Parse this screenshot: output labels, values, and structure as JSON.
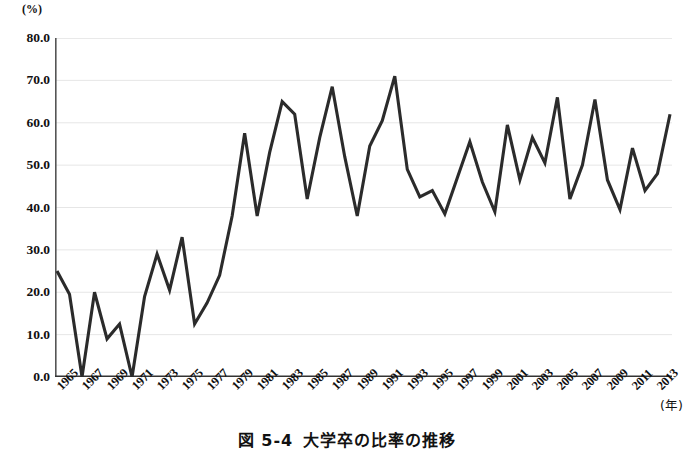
{
  "figure": {
    "caption_number": "図 5-4",
    "caption_title": "大学卒の比率の推移",
    "y_unit": "(%)",
    "x_unit": "(年)"
  },
  "chart_data": {
    "type": "line",
    "title": "大学卒の比率の推移",
    "xlabel": "(年)",
    "ylabel": "(%)",
    "ylim": [
      0.0,
      80.0
    ],
    "xlim": [
      1965,
      2014
    ],
    "grid": true,
    "legend": "none",
    "line_color": "#2b2b2b",
    "y_ticks": [
      "0.0",
      "10.0",
      "20.0",
      "30.0",
      "40.0",
      "50.0",
      "60.0",
      "70.0",
      "80.0"
    ],
    "y_tick_values": [
      0.0,
      10.0,
      20.0,
      30.0,
      40.0,
      50.0,
      60.0,
      70.0,
      80.0
    ],
    "x_tick_labels": [
      "1965",
      "1967",
      "1969",
      "1971",
      "1973",
      "1975",
      "1977",
      "1979",
      "1981",
      "1983",
      "1985",
      "1987",
      "1989",
      "1991",
      "1993",
      "1995",
      "1997",
      "1999",
      "2001",
      "2003",
      "2005",
      "2007",
      "2009",
      "2011",
      "2013"
    ],
    "x_tick_values": [
      1965,
      1967,
      1969,
      1971,
      1973,
      1975,
      1977,
      1979,
      1981,
      1983,
      1985,
      1987,
      1989,
      1991,
      1993,
      1995,
      1997,
      1999,
      2001,
      2003,
      2005,
      2007,
      2009,
      2011,
      2013
    ],
    "x": [
      1965,
      1966,
      1967,
      1968,
      1969,
      1970,
      1971,
      1972,
      1973,
      1974,
      1975,
      1976,
      1977,
      1978,
      1979,
      1980,
      1981,
      1982,
      1983,
      1984,
      1985,
      1986,
      1987,
      1988,
      1989,
      1990,
      1991,
      1992,
      1993,
      1994,
      1995,
      1996,
      1997,
      1998,
      1999,
      2000,
      2001,
      2002,
      2003,
      2004,
      2005,
      2006,
      2007,
      2008,
      2009,
      2010,
      2011,
      2012,
      2013,
      2014
    ],
    "values": [
      25.0,
      19.5,
      0.0,
      20.0,
      9.0,
      12.5,
      0.0,
      19.0,
      29.0,
      20.5,
      33.0,
      12.5,
      17.5,
      24.0,
      38.0,
      57.5,
      38.0,
      53.0,
      65.0,
      62.0,
      42.0,
      56.5,
      68.5,
      52.0,
      38.0,
      54.5,
      60.5,
      71.0,
      49.0,
      42.5,
      44.0,
      38.5,
      47.0,
      55.5,
      46.0,
      39.0,
      59.5,
      46.5,
      56.5,
      50.5,
      66.0,
      42.0,
      50.0,
      65.5,
      46.5,
      39.5,
      54.0,
      44.0,
      48.0,
      62.0
    ],
    "series_name": "大学卒の比率"
  }
}
